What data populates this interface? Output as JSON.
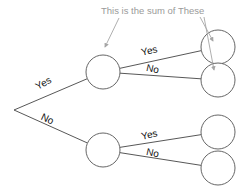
{
  "diagram": {
    "title_annotation": "This is the sum of These",
    "type": "decision-tree",
    "root": {
      "name": "root-vertex",
      "x": 14,
      "y": 110
    },
    "branches": [
      {
        "id": "root-yes",
        "label": "Yes",
        "from": "root-vertex",
        "to": "node-top",
        "label_x": 45,
        "label_y": 86,
        "rotate": -29
      },
      {
        "id": "root-no",
        "label": "No",
        "from": "root-vertex",
        "to": "node-bottom",
        "label_x": 46,
        "label_y": 122,
        "rotate": 25
      },
      {
        "id": "top-yes",
        "label": "Yes",
        "from": "node-top",
        "to": "leaf-top-1",
        "label_x": 150,
        "label_y": 54,
        "rotate": -13
      },
      {
        "id": "top-no",
        "label": "No",
        "from": "node-top",
        "to": "leaf-top-2",
        "label_x": 152,
        "label_y": 72,
        "rotate": 12
      },
      {
        "id": "bottom-yes",
        "label": "Yes",
        "from": "node-bottom",
        "to": "leaf-bottom-1",
        "label_x": 150,
        "label_y": 138,
        "rotate": -12
      },
      {
        "id": "bottom-no",
        "label": "No",
        "from": "node-bottom",
        "to": "leaf-bottom-2",
        "label_x": 152,
        "label_y": 156,
        "rotate": 12
      }
    ],
    "nodes": [
      {
        "id": "node-top",
        "name": "node-top",
        "cx": 103,
        "cy": 72,
        "r": 17
      },
      {
        "id": "node-bottom",
        "name": "node-bottom",
        "cx": 103,
        "cy": 150,
        "r": 17
      },
      {
        "id": "leaf-top-1",
        "name": "leaf-top-1",
        "cx": 218,
        "cy": 47,
        "r": 17
      },
      {
        "id": "leaf-top-2",
        "name": "leaf-top-2",
        "cx": 218,
        "cy": 80,
        "r": 17
      },
      {
        "id": "leaf-bottom-1",
        "name": "leaf-bottom-1",
        "cx": 218,
        "cy": 132,
        "r": 17
      },
      {
        "id": "leaf-bottom-2",
        "name": "leaf-bottom-2",
        "cx": 218,
        "cy": 168,
        "r": 17
      }
    ],
    "annotation_arrows": [
      {
        "id": "arrow-to-sum-node",
        "from_x": 119,
        "from_y": 18,
        "to_x": 105,
        "to_y": 47,
        "points_to": "node-top"
      },
      {
        "id": "arrow-to-leaf-1",
        "from_x": 200,
        "from_y": 17,
        "to_x": 213,
        "to_y": 41,
        "points_to": "leaf-top-1"
      },
      {
        "id": "arrow-to-leaf-2",
        "from_x": 204,
        "from_y": 17,
        "to_x": 214,
        "to_y": 70,
        "points_to": "leaf-top-2"
      }
    ],
    "annotation_position": {
      "x": 101,
      "y": 14
    },
    "colors": {
      "stroke": "#444444",
      "node_stroke": "#555555",
      "annotation": "#a6a6a6",
      "label": "#111111",
      "background": "#ffffff"
    }
  }
}
